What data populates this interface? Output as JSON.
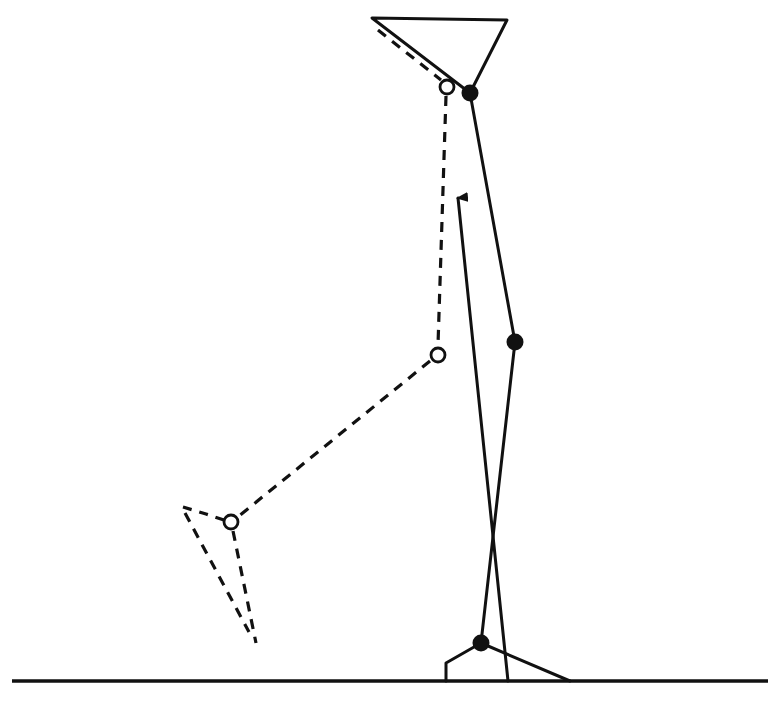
{
  "figure": {
    "colors": {
      "line": "#111111",
      "background": "#ffffff",
      "open_joint_fill": "#ffffff"
    },
    "ground": {
      "x1": 12,
      "y1": 681,
      "x2": 768,
      "y2": 681
    },
    "pelvis_triangle": {
      "points": "372,18 507,20 470,93"
    },
    "stance_leg": {
      "style": "solid",
      "joints": [
        {
          "name": "hip",
          "x": 470,
          "y": 93,
          "marker": "filled"
        },
        {
          "name": "knee",
          "x": 515,
          "y": 342,
          "marker": "filled"
        },
        {
          "name": "ankle",
          "x": 481,
          "y": 643,
          "marker": "filled"
        }
      ],
      "foot": {
        "heel_points": "481,643 446,663 446,681",
        "toe_points": "481,643 570,681"
      }
    },
    "swing_leg": {
      "style": "dashed",
      "joints": [
        {
          "name": "hip",
          "x": 447,
          "y": 87,
          "marker": "open"
        },
        {
          "name": "knee",
          "x": 438,
          "y": 355,
          "marker": "open"
        },
        {
          "name": "ankle",
          "x": 231,
          "y": 522,
          "marker": "open"
        }
      ],
      "pelvis_dash": {
        "x1": 378,
        "y1": 30,
        "x2": 441,
        "y2": 80
      },
      "foot": {
        "heel_top": "183,507 206,514 224,520",
        "sole_a": "183,510 249,632",
        "sole_b": "233,531 256,642"
      }
    },
    "force_arrow": {
      "x1": 508,
      "y1": 681,
      "x2": 458,
      "y2": 196,
      "direction": "up"
    },
    "caption": ""
  }
}
